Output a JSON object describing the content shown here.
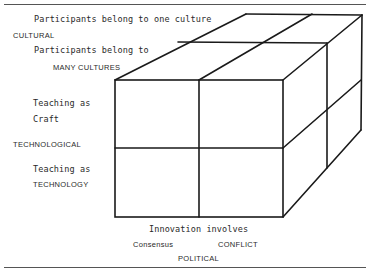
{
  "diagram": {
    "type": "3D cube matrix (2x2x2)",
    "labels": {
      "top_one_culture": "Participants belong to  one culture",
      "cultural_axis": "CULTURAL",
      "top_many_cultures_1": "Participants belong to",
      "top_many_cultures_2": "MANY CULTURES",
      "craft_1": "Teaching as",
      "craft_2": "Craft",
      "technological_axis": "TECHNOLOGICAL",
      "technology_1": "Teaching as",
      "technology_2": "TECHNOLOGY",
      "innovation": "Innovation involves",
      "consensus": "Consensus",
      "conflict": "CONFLICT",
      "political_axis": "POLITICAL"
    },
    "colors": {
      "line": "#1a1a1a",
      "text": "#2a2a2a",
      "background": "#ffffff"
    }
  }
}
